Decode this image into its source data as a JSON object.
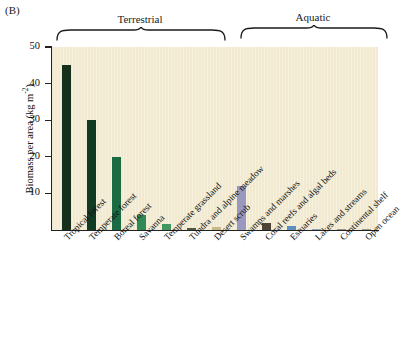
{
  "panel": {
    "label": "(B)"
  },
  "groups": [
    {
      "name": "terrestrial",
      "label": "Terrestrial"
    },
    {
      "name": "aquatic",
      "label": "Aquatic"
    }
  ],
  "axis": {
    "y_title_text": "Biomass per area (kg m",
    "y_title_exponent": "-2",
    "y_title_close": ")",
    "y_ticks": [
      "10",
      "20",
      "30",
      "40",
      "50"
    ]
  },
  "chart_data": {
    "type": "bar",
    "title": "(B)",
    "xlabel": "",
    "ylabel": "Biomass per area (kg m-2)",
    "ylim": [
      0,
      50
    ],
    "yticks": [
      10,
      20,
      30,
      40,
      50
    ],
    "grid": false,
    "legend": false,
    "group_brackets": [
      {
        "label": "Terrestrial",
        "categories": [
          "Tropical forest",
          "Temperate forest",
          "Boreal forest",
          "Savanna",
          "Temperate grassland",
          "Tundra and alpine meadow",
          "Desert scrub"
        ]
      },
      {
        "label": "Aquatic",
        "categories": [
          "Swamps and marshes",
          "Coral reefs and algal beds",
          "Estuaries",
          "Lakes and streams",
          "Continental shelf",
          "Open ocean"
        ]
      }
    ],
    "categories": [
      "Tropical forest",
      "Temperate forest",
      "Boreal forest",
      "Savanna",
      "Temperate grassland",
      "Tundra and alpine meadow",
      "Desert scrub",
      "Swamps and marshes",
      "Coral reefs and algal beds",
      "Estuaries",
      "Lakes and streams",
      "Continental shelf",
      "Open ocean"
    ],
    "values": [
      45,
      30,
      20,
      4,
      1.6,
      0.6,
      0.7,
      12,
      2,
      1,
      0.2,
      0.05,
      0.02
    ],
    "colors": [
      "#15301b",
      "#123b24",
      "#1a6b44",
      "#2e8b57",
      "#41975f",
      "#4a5b42",
      "#c8b88a",
      "#9a98bd",
      "#4d4336",
      "#5b8fc0",
      "#8fa7bd",
      "#9a9a8a",
      "#9a9a8a"
    ]
  },
  "colors": {
    "plot_background": "#f2ead0",
    "axis": "#222222",
    "text": "#111111"
  }
}
